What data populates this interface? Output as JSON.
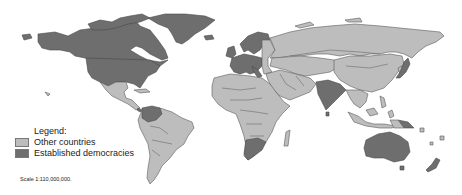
{
  "legend": {
    "title": "Legend:",
    "items": [
      {
        "label": "Other countries",
        "color": "#bdbdbd"
      },
      {
        "label": "Established democracies",
        "color": "#6e6e6e"
      }
    ]
  },
  "scale_text": "Scale 1:110,000,000.",
  "map": {
    "established_democracies": [
      "United States",
      "Canada",
      "Greenland",
      "Iceland",
      "United Kingdom",
      "Ireland",
      "Norway",
      "Sweden",
      "Finland",
      "Denmark",
      "Germany",
      "France",
      "Netherlands",
      "Belgium",
      "Switzerland",
      "Austria",
      "Italy",
      "Spain",
      "Portugal",
      "India",
      "Japan",
      "Colombia",
      "Venezuela",
      "Costa Rica",
      "South Africa",
      "Botswana",
      "Australia",
      "New Zealand",
      "Papua New Guinea",
      "Sri Lanka"
    ],
    "colors": {
      "other": "#bdbdbd",
      "democracy": "#6e6e6e",
      "border": "#5a5a5a"
    }
  }
}
